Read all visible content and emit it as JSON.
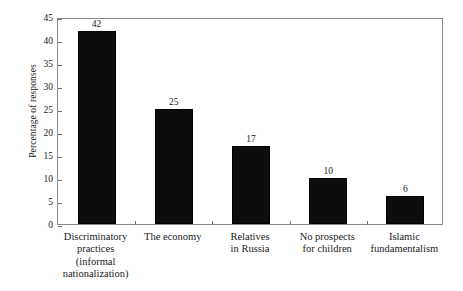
{
  "chart_data": {
    "type": "bar",
    "title": "",
    "subtitle": "",
    "xlabel": "",
    "ylabel": "Percentage of responses",
    "ylim": [
      0,
      45
    ],
    "yticks": [
      0,
      5,
      10,
      15,
      20,
      25,
      30,
      35,
      40,
      45
    ],
    "ytick_labels": [
      "0",
      "5",
      "10",
      "15",
      "20",
      "25",
      "30",
      "35",
      "40",
      "45"
    ],
    "grid": false,
    "legend": "none",
    "bar_color": "#0d0d0d",
    "frame_color": "#8a8a8a",
    "categories": [
      "Discriminatory practices (informal nationalization)",
      "The economy",
      "Relatives in Russia",
      "No prospects for children",
      "Islamic fundamentalism"
    ],
    "category_lines": [
      [
        "Discriminatory",
        "practices",
        "(informal",
        "nationalization)"
      ],
      [
        "The economy"
      ],
      [
        "Relatives",
        "in Russia"
      ],
      [
        "No prospects",
        "for children"
      ],
      [
        "Islamic",
        "fundamentalism"
      ]
    ],
    "values": [
      42,
      25,
      17,
      10,
      6
    ],
    "value_labels": [
      "42",
      "25",
      "17",
      "10",
      "6"
    ]
  }
}
